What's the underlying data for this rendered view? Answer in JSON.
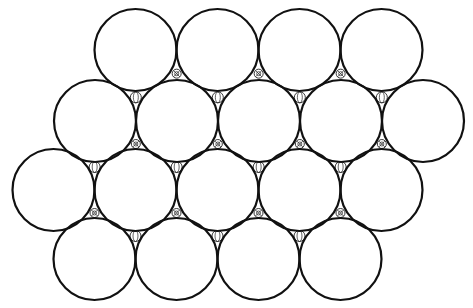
{
  "diagram": {
    "type": "hexagonal-circle-packing",
    "colors": {
      "background": "#ffffff",
      "stroke": "#111111"
    },
    "large_circle_radius": 41,
    "rows": [
      {
        "y": 50,
        "x": [
          135.5,
          217.5,
          299.5,
          381.5
        ]
      },
      {
        "y": 121,
        "x": [
          95,
          177,
          259,
          341,
          423
        ]
      },
      {
        "y": 190,
        "x": [
          53.5,
          135.5,
          217.5,
          299.5,
          381.5
        ]
      },
      {
        "y": 259,
        "x": [
          94.5,
          176.5,
          258.5,
          340.5
        ]
      }
    ],
    "interstitials": {
      "octahedral_style": "hatched",
      "tetrahedral_style": "open-with-line",
      "small_radius_hatched": 4.5,
      "small_radius_open": 5.5
    }
  }
}
